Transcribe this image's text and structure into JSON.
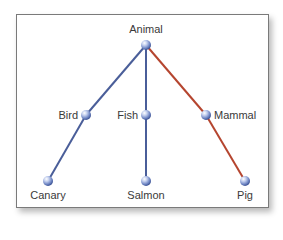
{
  "diagram": {
    "title": "",
    "type": "hierarchy-tree",
    "colors": {
      "edge_default": "#4a5e99",
      "edge_highlight": "#b5452f",
      "node_fill": "#6f86c4",
      "node_highlight": "#dfe6f7",
      "frame_border": "#7a7a7a",
      "label": "#3a3a3a"
    },
    "nodes": [
      {
        "id": "animal",
        "label": "Animal",
        "x": 146,
        "y": 45,
        "label_pos": "above"
      },
      {
        "id": "bird",
        "label": "Bird",
        "x": 86,
        "y": 115,
        "label_pos": "left"
      },
      {
        "id": "fish",
        "label": "Fish",
        "x": 146,
        "y": 115,
        "label_pos": "left"
      },
      {
        "id": "mammal",
        "label": "Mammal",
        "x": 206,
        "y": 115,
        "label_pos": "right"
      },
      {
        "id": "canary",
        "label": "Canary",
        "x": 48,
        "y": 181,
        "label_pos": "below"
      },
      {
        "id": "salmon",
        "label": "Salmon",
        "x": 146,
        "y": 181,
        "label_pos": "below"
      },
      {
        "id": "pig",
        "label": "Pig",
        "x": 245,
        "y": 181,
        "label_pos": "below"
      }
    ],
    "edges": [
      {
        "from": "animal",
        "to": "bird",
        "highlight": false
      },
      {
        "from": "animal",
        "to": "fish",
        "highlight": false
      },
      {
        "from": "animal",
        "to": "mammal",
        "highlight": true
      },
      {
        "from": "bird",
        "to": "canary",
        "highlight": false
      },
      {
        "from": "fish",
        "to": "salmon",
        "highlight": false
      },
      {
        "from": "mammal",
        "to": "pig",
        "highlight": true
      }
    ]
  }
}
